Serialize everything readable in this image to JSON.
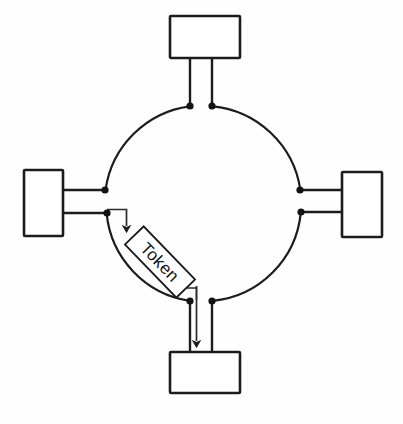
{
  "diagram": {
    "type": "token-ring-network",
    "title": "",
    "background_color": "#fefefe",
    "line_color": "#1c1c1c",
    "ring": {
      "name": "ring-bus",
      "center_x": 203,
      "center_y": 205,
      "radius": 98,
      "label": ""
    },
    "nodes": [
      {
        "id": "station-top",
        "label": "",
        "x": 170,
        "y": 16,
        "width": 70,
        "height": 42
      },
      {
        "id": "station-left",
        "label": "",
        "x": 24,
        "y": 170,
        "width": 39,
        "height": 66
      },
      {
        "id": "station-right",
        "label": "",
        "x": 342,
        "y": 172,
        "width": 40,
        "height": 65
      },
      {
        "id": "station-bottom",
        "label": "",
        "x": 170,
        "y": 352,
        "width": 70,
        "height": 41
      }
    ],
    "taps": [
      {
        "id": "tap-top-left",
        "x": 190,
        "y": 106
      },
      {
        "id": "tap-top-right",
        "x": 212,
        "y": 106
      },
      {
        "id": "tap-left-upper",
        "x": 105,
        "y": 190
      },
      {
        "id": "tap-left-lower",
        "x": 107,
        "y": 213
      },
      {
        "id": "tap-right-upper",
        "x": 300,
        "y": 190
      },
      {
        "id": "tap-right-lower",
        "x": 301,
        "y": 212
      },
      {
        "id": "tap-bottom-left",
        "x": 190,
        "y": 301
      },
      {
        "id": "tap-bottom-right",
        "x": 212,
        "y": 301
      }
    ],
    "token": {
      "label": "Token",
      "rotation_degrees": 46,
      "center_x": 160,
      "center_y": 262,
      "width": 74,
      "height": 26
    },
    "arrows": [
      {
        "id": "arrow-token-send",
        "from": "station-left",
        "to": "ring",
        "direction": "down"
      },
      {
        "id": "arrow-token-receive",
        "from": "ring",
        "to": "station-bottom",
        "direction": "down"
      }
    ]
  }
}
